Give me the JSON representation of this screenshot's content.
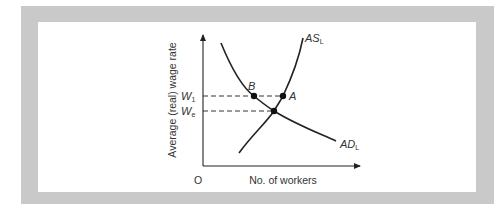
{
  "diagram": {
    "type": "labour-market-supply-demand",
    "y_axis_label": "Average (real) wage rate",
    "x_axis_label": "No. of workers",
    "origin_label": "O",
    "wage_levels": [
      {
        "label_main": "W",
        "label_sub": "1",
        "y": 96
      },
      {
        "label_main": "W",
        "label_sub": "e",
        "y": 111
      }
    ],
    "curves": {
      "supply": {
        "label_main": "AS",
        "label_sub": "L"
      },
      "demand": {
        "label_main": "AD",
        "label_sub": "L"
      }
    },
    "points": [
      {
        "label": "B"
      },
      {
        "label": "A"
      }
    ],
    "colors": {
      "frame": "#c9c9c9",
      "line": "#222222",
      "text": "#333333",
      "background": "#ffffff"
    }
  }
}
